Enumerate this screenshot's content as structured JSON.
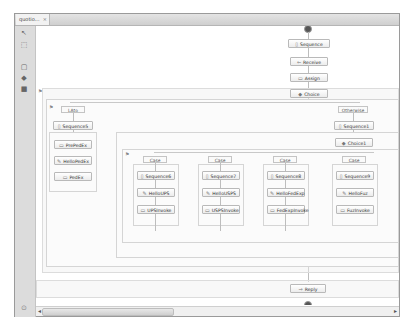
{
  "editor": {
    "tab_label": "quotio...",
    "tab_close": "×"
  },
  "palette": {
    "items": [
      {
        "name": "select-tool",
        "glyph": "↖"
      },
      {
        "name": "marquee-tool",
        "glyph": "⬚"
      },
      {
        "name": "action-group",
        "glyph": "▢"
      },
      {
        "name": "control-group",
        "glyph": "◆"
      },
      {
        "name": "fault-group",
        "glyph": "■"
      }
    ]
  },
  "process": {
    "main": [
      {
        "label": "Sequence",
        "icon": "▯"
      },
      {
        "label": "Receive",
        "icon": "⇐"
      },
      {
        "label": "Assign",
        "icon": "▭"
      },
      {
        "label": "Choice",
        "icon": "◆"
      }
    ],
    "when_label": "LAto",
    "otherwise_label": "Otherwise",
    "when_branch": [
      {
        "label": "Sequence5",
        "icon": "▯"
      },
      {
        "label": "PrePedEx",
        "icon": "▭"
      },
      {
        "label": "HelloPedEx",
        "icon": "✎"
      },
      {
        "label": "PedEx",
        "icon": "▭"
      }
    ],
    "otherwise_branch": [
      {
        "label": "Sequence1",
        "icon": "▯"
      },
      {
        "label": "Choice1",
        "icon": "◆"
      }
    ],
    "cases": [
      {
        "case": "Case",
        "sequence": "Sequence6",
        "hello": "HelloUPS",
        "invoke": "UPSInvoke"
      },
      {
        "case": "Case",
        "sequence": "Sequence7",
        "hello": "HelloUSPS",
        "invoke": "USPSInvoke"
      },
      {
        "case": "Case",
        "sequence": "Sequence8",
        "hello": "HelloFedExp",
        "invoke": "FedExpInvoke"
      },
      {
        "case": "Case",
        "sequence": "Sequence9",
        "hello": "HelloFuz",
        "invoke": "FuzInvoke"
      }
    ],
    "reply": {
      "label": "Reply",
      "icon": "⇒"
    }
  },
  "scrollbar": {
    "left_arrow": "◂",
    "right_arrow": "▸"
  }
}
